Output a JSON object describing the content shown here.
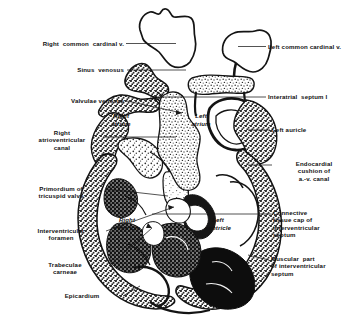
{
  "figure": {
    "background_color": "#ffffff",
    "ink_color": "#111111"
  },
  "labels_left": [
    {
      "id": "right-common-cardinal-v",
      "text": "Right  common  cardinal v.",
      "x": 12,
      "y": 40,
      "width": 112,
      "align": "right"
    },
    {
      "id": "sinus-venosus",
      "text": "Sinus  venosus",
      "x": 42,
      "y": 67,
      "width": 82,
      "align": "right"
    },
    {
      "id": "valvulae-venosae",
      "text": "Valvulae venosae",
      "x": 32,
      "y": 98,
      "width": 92,
      "align": "right"
    },
    {
      "id": "right-atrioventricular-canal",
      "text": "Right\natrioventricular\ncanal",
      "x": 24,
      "y": 130,
      "width": 76,
      "align": "center"
    },
    {
      "id": "primordium-of-tricuspid-valve",
      "text": "Primordium of\ntricuspid valve",
      "x": 18,
      "y": 186,
      "width": 86,
      "align": "center"
    },
    {
      "id": "interventricular-foramen",
      "text": "Interventricular\nforamen",
      "x": 18,
      "y": 228,
      "width": 86,
      "align": "center"
    },
    {
      "id": "trabeculae-carneae",
      "text": "Trabeculae\ncarneae",
      "x": 24,
      "y": 262,
      "width": 82,
      "align": "center"
    },
    {
      "id": "epicardium",
      "text": "Epicardium",
      "x": 44,
      "y": 293,
      "width": 76,
      "align": "center"
    }
  ],
  "labels_right": [
    {
      "id": "left-common-cardinal-v",
      "text": "Left common cardinal v.",
      "x": 268,
      "y": 44,
      "width": 88,
      "align": "left"
    },
    {
      "id": "interatrial-septum-i",
      "text": "Interatrial  septum I",
      "x": 268,
      "y": 94,
      "width": 88,
      "align": "left"
    },
    {
      "id": "left-auricle",
      "text": "Left auricle",
      "x": 272,
      "y": 127,
      "width": 84,
      "align": "left"
    },
    {
      "id": "endocardial-cushion-of-av-canal",
      "text": "Endocardial\ncushion of\na.-v. canal",
      "x": 274,
      "y": 161,
      "width": 80,
      "align": "center"
    },
    {
      "id": "connective-tissue-cap-of-interventricular-septum",
      "text": "Connective\ntissue cap of\ninterventricular\nseptum",
      "x": 273,
      "y": 210,
      "width": 82,
      "align": "left"
    },
    {
      "id": "muscular-part-of-interventricular-septum",
      "text": "Muscular  part\nof interventricular\nseptum",
      "x": 271,
      "y": 256,
      "width": 84,
      "align": "left"
    }
  ],
  "labels_inner": [
    {
      "id": "right-atrium",
      "text": "Right\natrium",
      "x": 100,
      "y": 113,
      "width": 42
    },
    {
      "id": "left-atrium",
      "text": "Left\natrium",
      "x": 181,
      "y": 113,
      "width": 40
    },
    {
      "id": "right-ventricle",
      "text": "Right\nventricle",
      "x": 104,
      "y": 217,
      "width": 46
    },
    {
      "id": "left-ventricle",
      "text": "Left\nventricle",
      "x": 196,
      "y": 217,
      "width": 44
    }
  ],
  "leader_lines": [
    {
      "id": "leader-right-common-cardinal-v",
      "from": [
        126,
        44
      ],
      "to": [
        178,
        44
      ]
    },
    {
      "id": "leader-sinus-venosus",
      "from": [
        126,
        70
      ],
      "to": [
        186,
        70
      ]
    },
    {
      "id": "leader-valvulae-venosae",
      "from": [
        126,
        101
      ],
      "to": [
        182,
        113
      ]
    },
    {
      "id": "leader-right-atrioventricular-canal",
      "from": [
        102,
        137
      ],
      "to": [
        177,
        137
      ]
    },
    {
      "id": "leader-primordium-of-tricuspid-valve",
      "from": [
        106,
        189
      ],
      "to": [
        166,
        196
      ]
    },
    {
      "id": "leader-interventricular-foramen",
      "from": [
        106,
        231
      ],
      "to": [
        172,
        208
      ]
    },
    {
      "id": "leader-trabeculae-carneae",
      "from": [
        108,
        266
      ],
      "to": [
        151,
        228
      ]
    },
    {
      "id": "leader-epicardium",
      "from": [
        122,
        296
      ],
      "to": [
        139,
        286
      ]
    },
    {
      "id": "leader-left-common-cardinal-v",
      "from": [
        266,
        47
      ],
      "to": [
        240,
        47
      ]
    },
    {
      "id": "leader-interatrial-septum-i",
      "from": [
        266,
        97
      ],
      "to": [
        150,
        97
      ]
    },
    {
      "id": "leader-left-auricle",
      "from": [
        270,
        130
      ],
      "to": [
        250,
        130
      ]
    },
    {
      "id": "leader-endocardial-cushion",
      "from": [
        272,
        165
      ],
      "to": [
        247,
        165
      ]
    },
    {
      "id": "leader-connective-tissue-cap",
      "from": [
        271,
        214
      ],
      "to": [
        150,
        214
      ]
    },
    {
      "id": "leader-muscular-part",
      "from": [
        269,
        260
      ],
      "to": [
        246,
        255
      ]
    },
    {
      "id": "leader-arrow-ivforamen",
      "from": [
        106,
        231
      ],
      "to": [
        175,
        207
      ]
    }
  ]
}
